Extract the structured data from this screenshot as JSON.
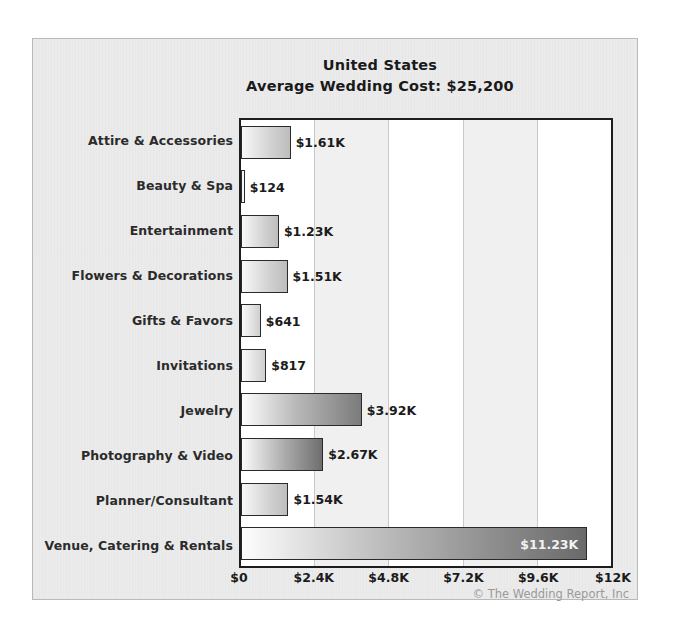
{
  "chart_data": {
    "type": "bar",
    "orientation": "horizontal",
    "title": "United States",
    "subtitle": "Average Wedding Cost: $25,200",
    "xlabel": "",
    "ylabel": "",
    "xlim": [
      0,
      12000
    ],
    "grid": true,
    "legend": null,
    "categories": [
      "Attire & Accessories",
      "Beauty & Spa",
      "Entertainment",
      "Flowers & Decorations",
      "Gifts & Favors",
      "Invitations",
      "Jewelry",
      "Photography & Video",
      "Planner/Consultant",
      "Venue, Catering & Rentals"
    ],
    "values": [
      1610,
      124,
      1230,
      1510,
      641,
      817,
      3920,
      2670,
      1540,
      11230
    ],
    "value_labels": [
      "$1.61K",
      "$124",
      "$1.23K",
      "$1.51K",
      "$641",
      "$817",
      "$3.92K",
      "$2.67K",
      "$1.54K",
      "$11.23K"
    ],
    "label_placement": [
      "outside",
      "outside",
      "outside",
      "outside",
      "outside",
      "outside",
      "outside",
      "outside",
      "outside",
      "inside"
    ],
    "xticks": [
      0,
      2400,
      4800,
      7200,
      9600,
      12000
    ],
    "xticklabels": [
      "$0",
      "$2.4K",
      "$4.8K",
      "$7.2K",
      "$9.6K",
      "$12K"
    ]
  },
  "footer": {
    "copyright": "© The Wedding Report, Inc"
  },
  "colors": {
    "frame_bg": "#ececed",
    "plot_bg": "#ffffff",
    "plot_border": "#1d1d1d",
    "band_shade": "#f0f0f0",
    "gridline": "#c8c8c8",
    "bar_border": "#2a2a2a",
    "text": "#1b1b1b",
    "copyright_text": "#9a9a9a"
  }
}
